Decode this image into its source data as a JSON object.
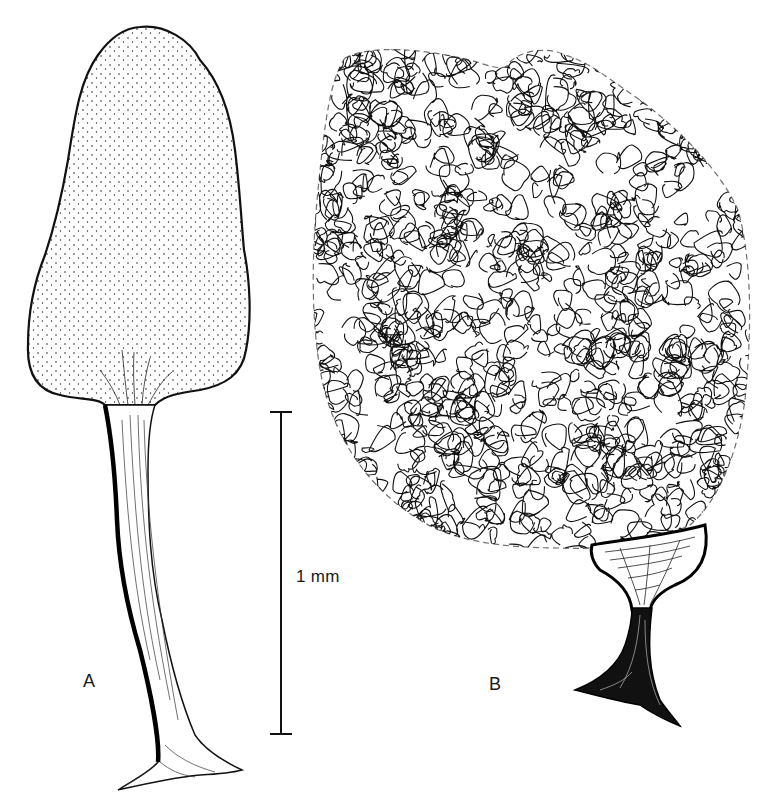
{
  "figure": {
    "panels": [
      {
        "id": "A",
        "label": "A",
        "description": "Stalked sporangium with stippled, elongate-ovoid head"
      },
      {
        "id": "B",
        "label": "B",
        "description": "Sporangium with expanded reticulate capillitium network on a cup-shaped stalk"
      }
    ],
    "scale_bar": {
      "label": "1 mm",
      "length_px": 322
    }
  },
  "colors": {
    "ink": "#111111",
    "background": "#ffffff"
  }
}
